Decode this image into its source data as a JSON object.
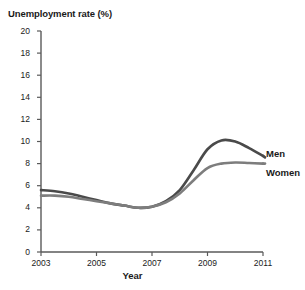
{
  "chart_data": {
    "type": "line",
    "title": "",
    "ylabel": "Unemployment rate (%)",
    "xlabel": "Year",
    "xlim": [
      2003,
      2011
    ],
    "ylim": [
      0,
      20
    ],
    "grid": false,
    "legend_position": "right-inline",
    "xticks": [
      "2003",
      "2005",
      "2007",
      "2009",
      "2011"
    ],
    "xtick_values": [
      2003,
      2005,
      2007,
      2009,
      2011
    ],
    "yticks": [
      "0",
      "2",
      "4",
      "6",
      "8",
      "10",
      "12",
      "14",
      "16",
      "18",
      "20"
    ],
    "ytick_values": [
      0,
      2,
      4,
      6,
      8,
      10,
      12,
      14,
      16,
      18,
      20
    ],
    "x": [
      2003,
      2003.5,
      2004,
      2004.5,
      2005,
      2005.5,
      2006,
      2006.5,
      2007,
      2007.5,
      2008,
      2008.5,
      2009,
      2009.5,
      2010,
      2010.5,
      2011
    ],
    "series": [
      {
        "name": "Men",
        "color": "#4a4a4a",
        "values": [
          5.6,
          5.5,
          5.3,
          5.0,
          4.7,
          4.4,
          4.2,
          4.0,
          4.1,
          4.6,
          5.6,
          7.4,
          9.3,
          10.1,
          10.0,
          9.4,
          8.7
        ]
      },
      {
        "name": "Women",
        "color": "#7d7d7d",
        "values": [
          5.1,
          5.1,
          5.0,
          4.8,
          4.6,
          4.4,
          4.2,
          4.0,
          4.1,
          4.5,
          5.3,
          6.5,
          7.6,
          8.0,
          8.1,
          8.05,
          8.0
        ]
      }
    ],
    "axis_color": "#5a5a5a"
  },
  "labels": {
    "men": "Men",
    "women": "Women"
  }
}
